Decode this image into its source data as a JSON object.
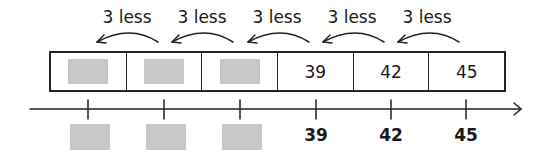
{
  "jumps": [
    {
      "label": "3 less"
    },
    {
      "label": "3 less"
    },
    {
      "label": "3 less"
    },
    {
      "label": "3 less"
    },
    {
      "label": "3 less"
    }
  ],
  "track": {
    "cells": [
      {
        "value": null,
        "blank": true
      },
      {
        "value": null,
        "blank": true
      },
      {
        "value": null,
        "blank": true
      },
      {
        "value": "39",
        "blank": false
      },
      {
        "value": "42",
        "blank": false
      },
      {
        "value": "45",
        "blank": false
      }
    ]
  },
  "number_line": {
    "ticks": [
      {
        "label": null,
        "blank": true
      },
      {
        "label": null,
        "blank": true
      },
      {
        "label": null,
        "blank": true
      },
      {
        "label": "39",
        "blank": false
      },
      {
        "label": "42",
        "blank": false
      },
      {
        "label": "45",
        "blank": false
      }
    ]
  },
  "colors": {
    "line": "#222222",
    "blank_fill": "#c8c8c8"
  }
}
